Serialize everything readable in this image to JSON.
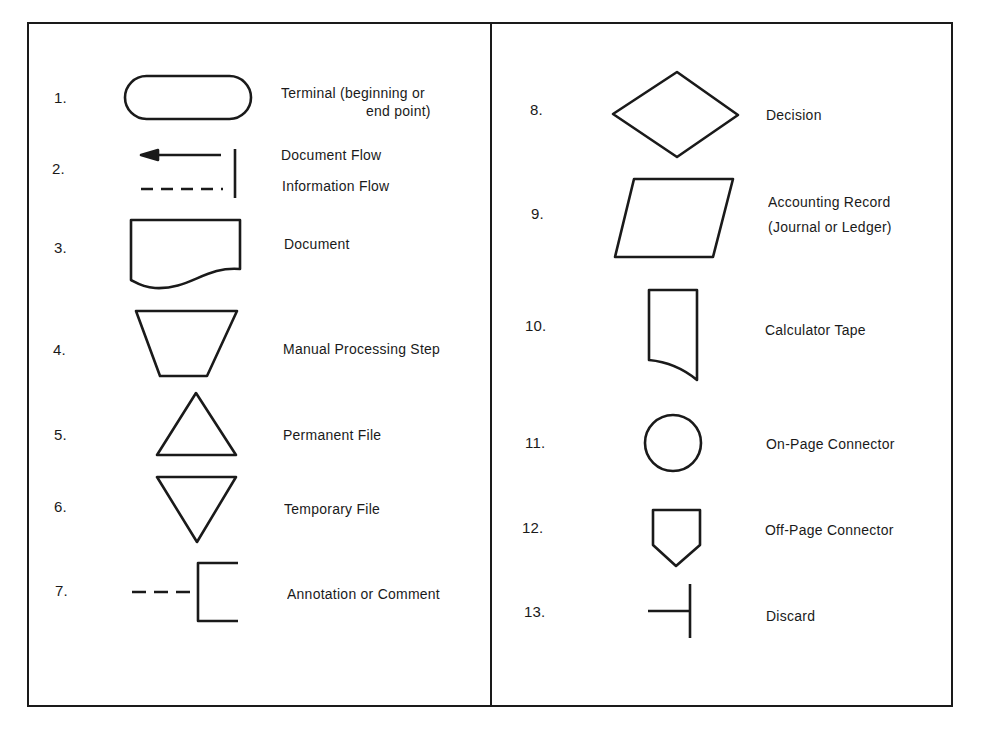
{
  "diagram": {
    "left_column": [
      {
        "number": "1.",
        "symbol": "terminal-icon",
        "label": "Terminal (beginning or",
        "label2": "end point)"
      },
      {
        "number": "2.",
        "symbol": "flow-lines-icon",
        "label": "Document Flow",
        "label2": "Information Flow"
      },
      {
        "number": "3.",
        "symbol": "document-icon",
        "label": "Document"
      },
      {
        "number": "4.",
        "symbol": "manual-processing-icon",
        "label": "Manual Processing Step"
      },
      {
        "number": "5.",
        "symbol": "permanent-file-icon",
        "label": "Permanent File"
      },
      {
        "number": "6.",
        "symbol": "temporary-file-icon",
        "label": "Temporary File"
      },
      {
        "number": "7.",
        "symbol": "annotation-icon",
        "label": "Annotation or Comment"
      }
    ],
    "right_column": [
      {
        "number": "8.",
        "symbol": "decision-icon",
        "label": "Decision"
      },
      {
        "number": "9.",
        "symbol": "accounting-record-icon",
        "label": "Accounting Record",
        "label2": "(Journal or Ledger)"
      },
      {
        "number": "10.",
        "symbol": "calculator-tape-icon",
        "label": "Calculator Tape"
      },
      {
        "number": "11.",
        "symbol": "on-page-connector-icon",
        "label": "On-Page Connector"
      },
      {
        "number": "12.",
        "symbol": "off-page-connector-icon",
        "label": "Off-Page Connector"
      },
      {
        "number": "13.",
        "symbol": "discard-icon",
        "label": "Discard"
      }
    ],
    "colors": {
      "ink": "#1a1a1a",
      "paper": "#ffffff"
    }
  }
}
